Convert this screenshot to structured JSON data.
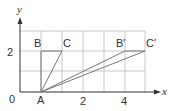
{
  "diagram": {
    "title": "",
    "axes": {
      "x_label": "x",
      "y_label": "y"
    },
    "tick_labels": {
      "x": [
        "2",
        "4"
      ],
      "y": [
        "2"
      ],
      "origin": "0"
    },
    "points": [
      {
        "name": "A",
        "x": 0,
        "y": 0
      },
      {
        "name": "B",
        "x": 0,
        "y": 2
      },
      {
        "name": "C",
        "x": 1,
        "y": 2
      },
      {
        "name": "B′",
        "x": 4,
        "y": 2
      },
      {
        "name": "C′",
        "x": 5,
        "y": 2
      }
    ],
    "segments": [
      [
        "A",
        "B"
      ],
      [
        "B",
        "C"
      ],
      [
        "A",
        "C"
      ],
      [
        "A",
        "B′"
      ],
      [
        "B′",
        "C′"
      ],
      [
        "A",
        "C′"
      ]
    ],
    "colors": {
      "grid": "#c8c8c8",
      "axis": "#333333",
      "shape": "#777777"
    }
  },
  "labels": {
    "A": "A",
    "B": "B",
    "C": "C",
    "Bp": "B′",
    "Cp": "C′",
    "origin": "0",
    "x2": "2",
    "x4": "4",
    "y2": "2",
    "x": "x",
    "y": "y"
  }
}
